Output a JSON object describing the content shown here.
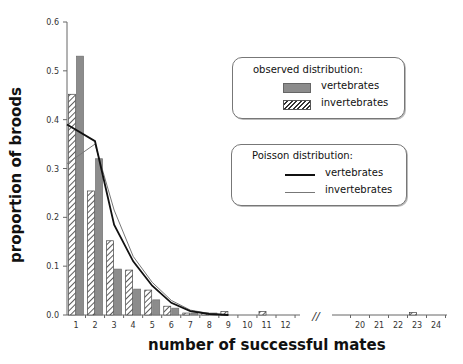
{
  "chart_data": {
    "type": "bar",
    "title": "",
    "xlabel": "number of successful mates",
    "ylabel": "proportion of broods",
    "ylim": [
      0,
      0.6
    ],
    "yticks": [
      "0.0",
      "0.1",
      "0.2",
      "0.3",
      "0.4",
      "0.5",
      "0.6"
    ],
    "grid": false,
    "axis_break": "//",
    "categories_segment1": [
      1,
      2,
      3,
      4,
      5,
      6,
      7,
      8,
      9,
      10,
      11,
      12
    ],
    "categories_segment2": [
      20,
      21,
      22,
      23,
      24
    ],
    "series": [
      {
        "name": "observed vertebrates",
        "kind": "bar",
        "style": "solid-gray",
        "x": [
          1,
          2,
          3,
          4,
          5,
          6,
          7,
          8,
          9,
          10,
          11,
          12,
          20,
          21,
          22,
          23,
          24
        ],
        "values": [
          0.53,
          0.32,
          0.094,
          0.053,
          0.031,
          0.014,
          0.004,
          0.004,
          0,
          0,
          0,
          0,
          0,
          0,
          0,
          0,
          0
        ]
      },
      {
        "name": "observed invertebrates",
        "kind": "bar",
        "style": "hatched",
        "x": [
          1,
          2,
          3,
          4,
          5,
          6,
          7,
          8,
          9,
          10,
          11,
          12,
          20,
          21,
          22,
          23,
          24
        ],
        "values": [
          0.452,
          0.254,
          0.152,
          0.092,
          0.051,
          0.018,
          0.004,
          0.004,
          0.007,
          0,
          0.007,
          0,
          0,
          0,
          0,
          0.005,
          0
        ]
      },
      {
        "name": "Poisson vertebrates",
        "kind": "line",
        "style": "thick-black",
        "x": [
          0.5,
          2,
          3,
          4,
          5,
          6,
          7,
          8,
          9
        ],
        "values": [
          0.39,
          0.356,
          0.185,
          0.11,
          0.06,
          0.025,
          0.008,
          0.002,
          0.0
        ]
      },
      {
        "name": "Poisson invertebrates",
        "kind": "line",
        "style": "thin-gray",
        "x": [
          0.5,
          2,
          3,
          4,
          5,
          6,
          7,
          8,
          9
        ],
        "values": [
          0.31,
          0.35,
          0.215,
          0.12,
          0.067,
          0.03,
          0.01,
          0.003,
          0.0
        ]
      }
    ],
    "legend": {
      "observed": {
        "title": "observed distribution:",
        "entries": [
          "vertebrates",
          "invertebrates"
        ]
      },
      "poisson": {
        "title": "Poisson distribution:",
        "entries": [
          "vertebrates",
          "invertebrates"
        ]
      },
      "position": "upper right"
    },
    "colors": {
      "vertebrate_bar": "#8c8c8c",
      "hatch": "#333333",
      "poisson_vertebrates": "#111111",
      "poisson_invertebrates": "#777777"
    }
  }
}
